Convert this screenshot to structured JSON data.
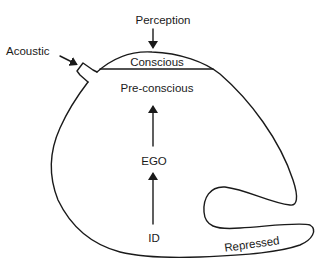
{
  "diagram": {
    "type": "Freud structural model of the mind",
    "labels": {
      "perception": "Perception",
      "acoustic": "Acoustic",
      "conscious": "Conscious",
      "preconscious": "Pre-conscious",
      "ego": "EGO",
      "id": "ID",
      "repressed": "Repressed"
    },
    "arrows": [
      {
        "from": "Perception",
        "to": "Conscious",
        "direction": "down"
      },
      {
        "from": "Acoustic",
        "to": "acoustic-cap",
        "direction": "down-right"
      },
      {
        "from": "EGO",
        "to": "Pre-conscious",
        "direction": "up"
      },
      {
        "from": "ID",
        "to": "EGO",
        "direction": "up"
      }
    ],
    "colors": {
      "line": "#1a1a1a",
      "background": "#ffffff"
    }
  }
}
